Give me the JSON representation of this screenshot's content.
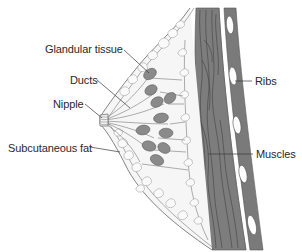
{
  "diagram": {
    "type": "anatomical-cross-section",
    "colors": {
      "background": "#ffffff",
      "outline": "#6e6e6e",
      "muscle": "#7d7d7d",
      "rib_band": "#7a7a7a",
      "rib": "#ffffff",
      "lobule": "#8a8a8a",
      "fat_fill": "#f4f4f4",
      "label_text": "#2a2a2a",
      "leader_line": "#3a3a3a"
    },
    "labels": [
      {
        "id": "glandular-tissue",
        "text": "Glandular tissue",
        "side": "left"
      },
      {
        "id": "ducts",
        "text": "Ducts",
        "side": "left"
      },
      {
        "id": "nipple",
        "text": "Nipple",
        "side": "left"
      },
      {
        "id": "subcutaneous-fat",
        "text": "Subcutaneous fat",
        "side": "left"
      },
      {
        "id": "ribs",
        "text": "Ribs",
        "side": "right"
      },
      {
        "id": "muscles",
        "text": "Muscles",
        "side": "right"
      }
    ]
  }
}
